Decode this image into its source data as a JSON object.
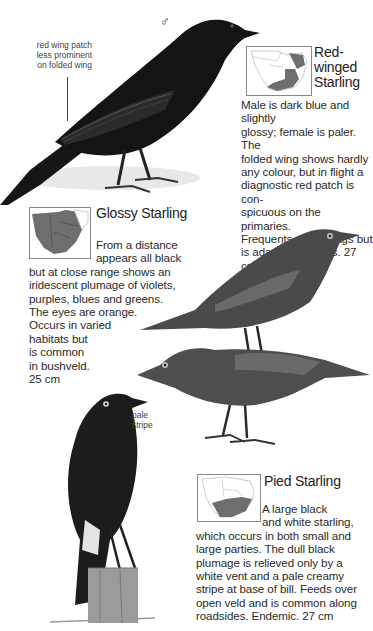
{
  "colors": {
    "range_fill": "#6e6e6e",
    "bird_dark": "#141414",
    "text": "#2a2a2a",
    "map_border": "#888888"
  },
  "annotations": {
    "male_symbol": "♂",
    "red_wing_note": [
      "red wing patch",
      "less prominent",
      "on folded wing"
    ],
    "pale_stripe_note": [
      "pale",
      "stripe"
    ]
  },
  "species": [
    {
      "name_lines": [
        "Red-",
        "winged",
        "Starling"
      ],
      "description_lines": [
        "Male is dark blue and slightly",
        "glossy; female is paler. The",
        "folded wing shows hardly",
        "any colour, but in flight a",
        "diagnostic red patch is con-",
        "spicuous on the primaries.",
        "Frequents rocky crags but",
        "is adapting to cities. 27 cm"
      ],
      "map_icon": "southern-africa-range-map-east"
    },
    {
      "name_lines": [
        "Glossy Starling"
      ],
      "description_lines": [
        "From a distance",
        "appears all black",
        "but at close range shows an",
        "iridescent plumage of violets,",
        "purples, blues and greens.",
        "The eyes are orange.",
        "Occurs in varied",
        "habitats but",
        "is common",
        "in bushveld.",
        "25 cm"
      ],
      "map_icon": "southern-africa-range-map-widespread"
    },
    {
      "name_lines": [
        "Pied Starling"
      ],
      "description_lines": [
        "A large black",
        "and white starling,",
        "which occurs in both small and",
        "large parties. The dull black",
        "plumage is relieved only by a",
        "white vent and a pale creamy",
        "stripe at base of bill. Feeds over",
        "open veld and is common along",
        "roadsides. Endemic. 27 cm"
      ],
      "map_icon": "southern-africa-range-map-south"
    }
  ]
}
